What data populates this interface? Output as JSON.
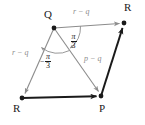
{
  "figure": {
    "type": "geometry-diagram",
    "colors": {
      "vector_gray": "#8c8c8c",
      "edge_dark": "#1a1a1a",
      "background": "#ffffff",
      "text": "#1a1a1a"
    },
    "vertices": [
      {
        "id": "Q",
        "label": "Q",
        "x": 54,
        "y": 28,
        "label_x": 44,
        "label_y": 9,
        "dot": true
      },
      {
        "id": "Rtr",
        "label": "R",
        "x": 124,
        "y": 23,
        "label_x": 124,
        "label_y": 2,
        "dot": true
      },
      {
        "id": "P",
        "label": "P",
        "x": 101,
        "y": 96,
        "label_x": 99,
        "label_y": 103,
        "dot": true
      },
      {
        "id": "Rbl",
        "label": "R",
        "x": 22,
        "y": 98,
        "label_x": 13,
        "label_y": 103,
        "dot": true
      }
    ],
    "vectors": [
      {
        "id": "Q-to-Rtr",
        "from": "Q",
        "to": "Rtr",
        "label": "r − q",
        "label_x": 73,
        "label_y": 8,
        "color": "#8c8c8c"
      },
      {
        "id": "Q-to-Rbl",
        "from": "Q",
        "to": "Rbl",
        "label": "r − q",
        "label_x": 12,
        "label_y": 49,
        "color": "#8c8c8c"
      },
      {
        "id": "Q-to-P",
        "from": "Q",
        "to": "P",
        "label": "p − q",
        "label_x": 84,
        "label_y": 55,
        "color": "#8c8c8c"
      }
    ],
    "edges": [
      {
        "id": "Rbl-to-P",
        "from": "Rbl",
        "to": "P",
        "color": "#1a1a1a"
      },
      {
        "id": "P-to-Rtr",
        "from": "P",
        "to": "Rtr",
        "color": "#1a1a1a"
      }
    ],
    "angles": [
      {
        "id": "angle-right",
        "sign": "",
        "numerator": "π",
        "denominator": "3",
        "label_x": 70,
        "label_y": 33,
        "arc_from": "Q-to-Rtr",
        "arc_to": "Q-to-P"
      },
      {
        "id": "angle-left",
        "sign": "−",
        "numerator": "π",
        "denominator": "3",
        "label_x": 44,
        "label_y": 53,
        "arc_from": "Q-to-Rbl",
        "arc_to": "Q-to-P"
      }
    ]
  }
}
